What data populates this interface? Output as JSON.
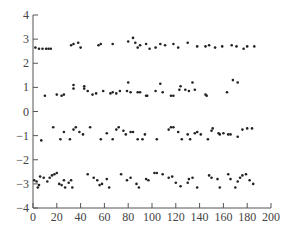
{
  "chart_data": {
    "type": "scatter",
    "title": "",
    "xlabel": "",
    "ylabel": "",
    "xlim": [
      0,
      200
    ],
    "ylim": [
      -4,
      4
    ],
    "xticks": [
      0,
      20,
      40,
      60,
      80,
      100,
      120,
      140,
      160,
      180,
      200
    ],
    "yticks": [
      -4,
      -3,
      -2,
      -1,
      0,
      1,
      2,
      3,
      4
    ],
    "grid": false,
    "legend": null,
    "marker_color": "#222222",
    "series": [
      {
        "name": "band_high",
        "points": [
          [
            2,
            2.65
          ],
          [
            5,
            2.6
          ],
          [
            8,
            2.6
          ],
          [
            11,
            2.6
          ],
          [
            13,
            2.6
          ],
          [
            15,
            2.6
          ],
          [
            32,
            2.75
          ],
          [
            34,
            2.8
          ],
          [
            38,
            2.85
          ],
          [
            40,
            2.65
          ],
          [
            55,
            2.75
          ],
          [
            57,
            2.8
          ],
          [
            67,
            2.8
          ],
          [
            80,
            2.9
          ],
          [
            84,
            3.05
          ],
          [
            86,
            2.85
          ],
          [
            88,
            2.65
          ],
          [
            90,
            2.75
          ],
          [
            95,
            2.8
          ],
          [
            98,
            2.6
          ],
          [
            103,
            2.65
          ],
          [
            107,
            2.8
          ],
          [
            111,
            2.75
          ],
          [
            118,
            2.8
          ],
          [
            122,
            2.65
          ],
          [
            130,
            2.85
          ],
          [
            138,
            2.7
          ],
          [
            145,
            2.7
          ],
          [
            148,
            2.75
          ],
          [
            153,
            2.65
          ],
          [
            159,
            2.7
          ],
          [
            167,
            2.75
          ],
          [
            171,
            2.7
          ],
          [
            177,
            2.6
          ],
          [
            180,
            2.7
          ],
          [
            186,
            2.7
          ]
        ]
      },
      {
        "name": "band_mid_high",
        "points": [
          [
            10,
            0.65
          ],
          [
            20,
            0.7
          ],
          [
            24,
            0.65
          ],
          [
            26,
            0.7
          ],
          [
            34,
            0.95
          ],
          [
            34,
            1.1
          ],
          [
            43,
            1.05
          ],
          [
            43,
            0.95
          ],
          [
            46,
            0.85
          ],
          [
            50,
            0.7
          ],
          [
            53,
            0.75
          ],
          [
            59,
            0.85
          ],
          [
            65,
            0.75
          ],
          [
            67,
            0.8
          ],
          [
            70,
            0.75
          ],
          [
            73,
            0.85
          ],
          [
            79,
            0.85
          ],
          [
            80,
            1.2
          ],
          [
            82,
            0.8
          ],
          [
            88,
            0.8
          ],
          [
            90,
            0.8
          ],
          [
            95,
            0.65
          ],
          [
            96,
            0.65
          ],
          [
            103,
            0.85
          ],
          [
            107,
            1.15
          ],
          [
            109,
            0.8
          ],
          [
            116,
            0.65
          ],
          [
            118,
            0.65
          ],
          [
            123,
            0.9
          ],
          [
            124,
            1.05
          ],
          [
            128,
            0.9
          ],
          [
            131,
            0.85
          ],
          [
            134,
            1.2
          ],
          [
            136,
            0.9
          ],
          [
            145,
            0.7
          ],
          [
            146,
            0.65
          ],
          [
            163,
            0.8
          ],
          [
            168,
            1.3
          ],
          [
            172,
            1.2
          ]
        ]
      },
      {
        "name": "band_mid_low",
        "points": [
          [
            7,
            -1.2
          ],
          [
            17,
            -0.65
          ],
          [
            23,
            -1.15
          ],
          [
            26,
            -0.85
          ],
          [
            31,
            -1.15
          ],
          [
            34,
            -0.75
          ],
          [
            36,
            -0.65
          ],
          [
            39,
            -0.85
          ],
          [
            42,
            -0.95
          ],
          [
            48,
            -0.65
          ],
          [
            57,
            -1.15
          ],
          [
            62,
            -0.9
          ],
          [
            67,
            -1.15
          ],
          [
            70,
            -0.75
          ],
          [
            72,
            -0.65
          ],
          [
            76,
            -0.8
          ],
          [
            78,
            -0.95
          ],
          [
            82,
            -0.85
          ],
          [
            84,
            -0.85
          ],
          [
            88,
            -1.15
          ],
          [
            92,
            -1.15
          ],
          [
            94,
            -0.95
          ],
          [
            104,
            -1.15
          ],
          [
            114,
            -0.75
          ],
          [
            116,
            -0.65
          ],
          [
            118,
            -0.65
          ],
          [
            122,
            -0.85
          ],
          [
            125,
            -1.15
          ],
          [
            130,
            -0.95
          ],
          [
            132,
            -1.15
          ],
          [
            136,
            -0.9
          ],
          [
            138,
            -0.85
          ],
          [
            141,
            -0.95
          ],
          [
            147,
            -1.15
          ],
          [
            150,
            -0.8
          ],
          [
            151,
            -0.7
          ],
          [
            156,
            -0.9
          ],
          [
            157,
            -0.95
          ],
          [
            160,
            -0.9
          ],
          [
            164,
            -0.95
          ],
          [
            166,
            -0.95
          ],
          [
            172,
            -1.05
          ],
          [
            176,
            -0.75
          ],
          [
            180,
            -0.7
          ],
          [
            184,
            -0.7
          ]
        ]
      },
      {
        "name": "band_low",
        "points": [
          [
            1,
            -2.85
          ],
          [
            3,
            -2.9
          ],
          [
            4,
            -3.15
          ],
          [
            5,
            -3.05
          ],
          [
            6,
            -2.7
          ],
          [
            9,
            -2.75
          ],
          [
            12,
            -2.9
          ],
          [
            14,
            -2.75
          ],
          [
            16,
            -2.65
          ],
          [
            18,
            -2.6
          ],
          [
            20,
            -2.55
          ],
          [
            22,
            -3.0
          ],
          [
            24,
            -3.05
          ],
          [
            26,
            -2.85
          ],
          [
            27,
            -3.15
          ],
          [
            30,
            -2.95
          ],
          [
            32,
            -2.85
          ],
          [
            33,
            -3.15
          ],
          [
            46,
            -2.6
          ],
          [
            51,
            -2.75
          ],
          [
            54,
            -2.85
          ],
          [
            56,
            -3.05
          ],
          [
            58,
            -3.0
          ],
          [
            62,
            -2.8
          ],
          [
            64,
            -3.15
          ],
          [
            74,
            -2.6
          ],
          [
            79,
            -2.85
          ],
          [
            82,
            -2.75
          ],
          [
            87,
            -3.0
          ],
          [
            89,
            -3.15
          ],
          [
            95,
            -2.8
          ],
          [
            97,
            -2.85
          ],
          [
            102,
            -2.55
          ],
          [
            104,
            -2.55
          ],
          [
            109,
            -2.6
          ],
          [
            114,
            -2.75
          ],
          [
            117,
            -2.7
          ],
          [
            120,
            -2.95
          ],
          [
            124,
            -3.1
          ],
          [
            130,
            -2.95
          ],
          [
            131,
            -2.8
          ],
          [
            134,
            -2.75
          ],
          [
            138,
            -3.15
          ],
          [
            148,
            -2.65
          ],
          [
            150,
            -2.75
          ],
          [
            155,
            -2.8
          ],
          [
            157,
            -3.15
          ],
          [
            164,
            -2.6
          ],
          [
            166,
            -2.8
          ],
          [
            170,
            -3.15
          ],
          [
            172,
            -2.9
          ],
          [
            174,
            -2.75
          ],
          [
            176,
            -2.65
          ],
          [
            179,
            -2.6
          ],
          [
            182,
            -2.85
          ],
          [
            185,
            -3.0
          ]
        ]
      }
    ]
  }
}
